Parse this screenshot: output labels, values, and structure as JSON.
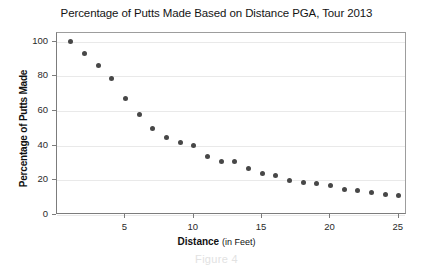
{
  "chart_data": {
    "type": "scatter",
    "title": "Percentage of Putts Made Based on Distance PGA, Tour 2013",
    "xlabel_bold": "Distance",
    "xlabel_unit": "(in Feet)",
    "ylabel": "Percentage of Putts Made",
    "caption": "Figure 4",
    "xlim": [
      0,
      25.6
    ],
    "ylim": [
      0,
      105
    ],
    "xticks": [
      5,
      10,
      15,
      20,
      25
    ],
    "yticks": [
      0,
      20,
      40,
      60,
      80,
      100
    ],
    "grid": "horizontal",
    "legend": "none",
    "marker_color": "#474747",
    "grid_color": "#e9e9e9",
    "axis_color": "#7c7c7c",
    "x": [
      1,
      2,
      3,
      4,
      5,
      6,
      7,
      8,
      9,
      10,
      11,
      12,
      13,
      14,
      15,
      16,
      17,
      18,
      19,
      20,
      21,
      22,
      23,
      24,
      25
    ],
    "y": [
      100,
      93,
      86,
      79,
      67,
      58,
      50,
      45,
      42,
      40,
      34,
      31,
      31,
      27,
      24,
      23,
      20,
      19,
      18,
      17,
      15,
      14,
      13,
      12,
      11
    ]
  }
}
